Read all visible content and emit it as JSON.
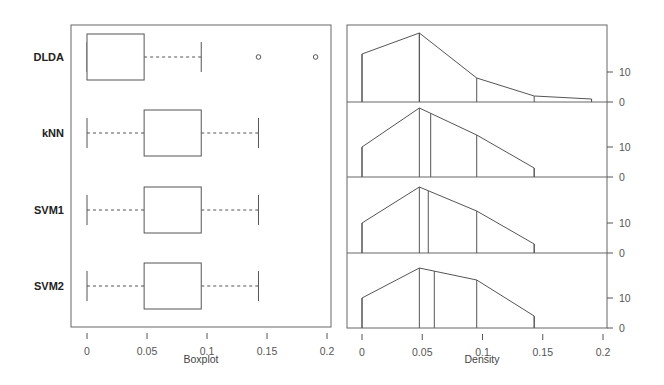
{
  "chart_data": [
    {
      "type": "boxplot",
      "title": "",
      "xlabel": "Boxplot",
      "ylabel": "",
      "xlim": [
        0,
        0.2
      ],
      "x_ticks": [
        "0",
        "0.05",
        "0.1",
        "0.15",
        "0.2"
      ],
      "x_tick_values": [
        0,
        0.05,
        0.1,
        0.15,
        0.2
      ],
      "grid": false,
      "orientation": "horizontal",
      "categories": [
        "DLDA",
        "kNN",
        "SVM1",
        "SVM2"
      ],
      "series": [
        {
          "name": "DLDA",
          "whisker_low": 0,
          "q1": 0,
          "median": 0,
          "q3": 0.0476,
          "whisker_high": 0.0952,
          "outliers": [
            0.1429,
            0.1905
          ]
        },
        {
          "name": "kNN",
          "whisker_low": 0,
          "q1": 0.0476,
          "median": 0.0476,
          "q3": 0.0952,
          "whisker_high": 0.1429,
          "outliers": []
        },
        {
          "name": "SVM1",
          "whisker_low": 0,
          "q1": 0.0476,
          "median": 0.0476,
          "q3": 0.0952,
          "whisker_high": 0.1429,
          "outliers": []
        },
        {
          "name": "SVM2",
          "whisker_low": 0,
          "q1": 0.0476,
          "median": 0.0476,
          "q3": 0.0952,
          "whisker_high": 0.1429,
          "outliers": []
        }
      ]
    },
    {
      "type": "area",
      "title": "",
      "xlabel": "Density",
      "ylabel": "",
      "xlim": [
        0,
        0.2
      ],
      "x_ticks": [
        "0",
        "0.05",
        "0.1",
        "0.15",
        "0.2"
      ],
      "x_tick_values": [
        0,
        0.05,
        0.1,
        0.15,
        0.2
      ],
      "y_ticks": [
        "0",
        "10"
      ],
      "y_tick_values": [
        0,
        10
      ],
      "ylim_per_strip": [
        0,
        25
      ],
      "grid": false,
      "layout": "stacked strips, one per classifier, shared x-axis, y-axis on right",
      "x": [
        0,
        0.0476,
        0.0952,
        0.1429,
        0.1905
      ],
      "series": [
        {
          "name": "DLDA",
          "values": [
            16,
            23,
            8,
            2,
            1
          ],
          "median_line": 0.0476
        },
        {
          "name": "kNN",
          "values": [
            10,
            23,
            14,
            3,
            null
          ],
          "median_line": 0.057
        },
        {
          "name": "SVM1",
          "values": [
            10,
            22,
            14,
            3,
            null
          ],
          "median_line": 0.055
        },
        {
          "name": "SVM2",
          "values": [
            10,
            20,
            16,
            4,
            null
          ],
          "median_line": 0.06
        }
      ]
    }
  ],
  "labels": {
    "groups": [
      "DLDA",
      "kNN",
      "SVM1",
      "SVM2"
    ],
    "left_xlabel": "Boxplot",
    "right_xlabel": "Density",
    "x_ticks": [
      "0",
      "0.05",
      "0.1",
      "0.15",
      "0.2"
    ],
    "y_ticks_right": [
      "10",
      "0"
    ]
  },
  "colors": {
    "line": "#555555",
    "frame": "#666666",
    "background": "#ffffff"
  }
}
